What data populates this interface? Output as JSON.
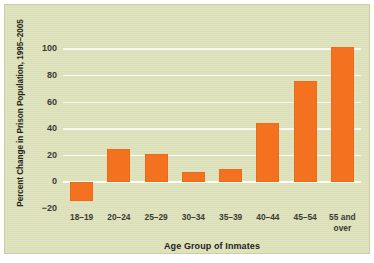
{
  "chart_data": {
    "type": "bar",
    "title": "",
    "xlabel": "Age Group of Inmates",
    "ylabel": "Percent Change in Prison Population, 1995–2005",
    "categories": [
      "18–19",
      "20–24",
      "25–29",
      "30–34",
      "35–39",
      "40–44",
      "45–54",
      "55 and\nover"
    ],
    "values": [
      -14,
      25,
      21,
      8,
      10,
      45,
      76,
      102
    ],
    "ylim": [
      -20,
      110
    ],
    "yticks": [
      -20,
      0,
      20,
      40,
      60,
      80,
      100
    ],
    "ytick_labels": [
      "−20",
      "0",
      "20",
      "40",
      "60",
      "80",
      "100"
    ],
    "grid": true,
    "legend": "none",
    "bar_color": "#f4711f",
    "background_color": "#dfe3bc",
    "gridline_color": "#f7f8ee",
    "text_color": "#231f20"
  }
}
